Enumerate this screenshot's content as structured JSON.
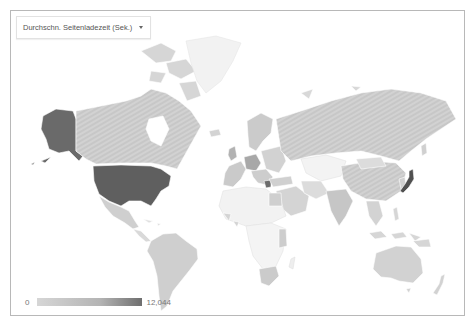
{
  "metric_selector": {
    "selected_label": "Durchschn. Seitenladezeit (Sek.)",
    "icon": "chevron-down-icon"
  },
  "legend": {
    "min_label": "0",
    "max_label": "12,044",
    "color_min": "#d6d6d6",
    "color_max": "#6e6e6e"
  },
  "map": {
    "type": "choropleth-world",
    "colors": {
      "no_data": "#f4f4f4",
      "low": "#d4d4d4",
      "mid": "#bdbdbd",
      "high": "#707070",
      "border": "#ffffff",
      "frame": "#b8b8b8"
    },
    "highlighted_regions": [
      {
        "name": "United States",
        "shade": "high"
      },
      {
        "name": "Alaska",
        "shade": "high"
      },
      {
        "name": "Japan",
        "shade": "high"
      },
      {
        "name": "Greece",
        "shade": "high"
      },
      {
        "name": "Germany",
        "shade": "mid"
      }
    ]
  }
}
